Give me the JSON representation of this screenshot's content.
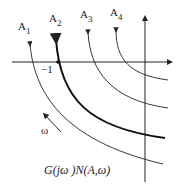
{
  "diagram": {
    "curve_labels": [
      "A",
      "A",
      "A",
      "A"
    ],
    "curve_subscripts": [
      "1",
      "2",
      "3",
      "4"
    ],
    "point_label": "−1",
    "direction_label": "ω",
    "caption": "G(jω )N(A,ω)",
    "colors": {
      "line": "#222222",
      "background": "#ffffff"
    }
  }
}
